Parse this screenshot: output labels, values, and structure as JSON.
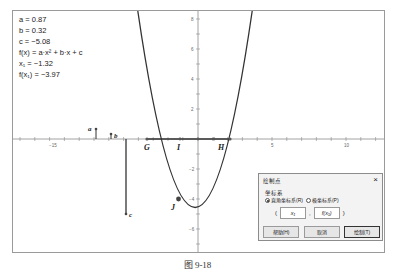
{
  "algebra": {
    "a_line": "a = 0.87",
    "b_line": "b = 0.32",
    "c_line": "c = −5.08",
    "f_line": "f(x) = a·x² + b·x + c",
    "x1_line": "x₁ = −1.32",
    "fx1_line": "f(x₁) = −3.97"
  },
  "values": {
    "a": 0.87,
    "b": 0.32,
    "c": -5.08,
    "x1": -1.32,
    "fx1": -3.97
  },
  "axes": {
    "x_ticks": [
      {
        "value": -15,
        "label": "−15"
      },
      {
        "value": 5,
        "label": "5"
      },
      {
        "value": 10,
        "label": "10"
      }
    ],
    "y_ticks": [
      {
        "value": 8,
        "label": "8"
      },
      {
        "value": 6,
        "label": "6"
      },
      {
        "value": 4,
        "label": "4"
      },
      {
        "value": 2,
        "label": "2"
      },
      {
        "value": -2,
        "label": "−2"
      },
      {
        "value": -4,
        "label": "−4"
      },
      {
        "value": -6,
        "label": "−6"
      }
    ]
  },
  "points": {
    "G": "G",
    "I": "I",
    "H": "H",
    "J": "J",
    "slider_a": "a",
    "slider_b": "b",
    "slider_c": "c"
  },
  "dialog": {
    "title": "绘制点",
    "close": "×",
    "group_label": "坐标系",
    "radio_rect": "直角坐标系(R)",
    "radio_polar": "极坐标系(P)",
    "coord_open": "(",
    "coord_x": "x₁",
    "coord_sep": ",",
    "coord_y": "f(x₁)",
    "coord_close": ")",
    "help_button": "帮助(H)",
    "cancel_button": "取消",
    "plot_button": "绘制(T)"
  },
  "caption": "图 9-18",
  "colors": {
    "curve": "#333333",
    "axis": "#8a8a8a",
    "frame": "#9a9a9a",
    "dialog_bg": "#f3f3f3"
  }
}
